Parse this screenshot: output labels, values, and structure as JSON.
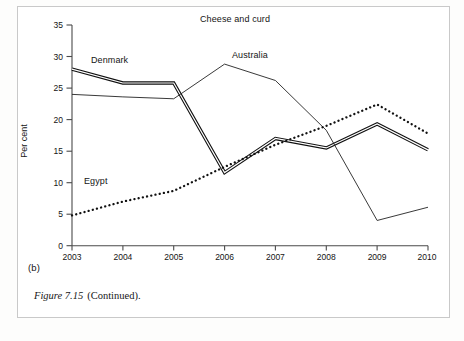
{
  "figure": {
    "panel_letter": "(b)",
    "caption_number": "Figure 7.15",
    "caption_text": "(Continued)."
  },
  "chart_data": {
    "type": "line",
    "title": "Cheese and curd",
    "xlabel": "",
    "ylabel": "Per cent",
    "x": [
      "2003",
      "2004",
      "2005",
      "2006",
      "2007",
      "2008",
      "2009",
      "2010"
    ],
    "categories": [
      "2003",
      "2004",
      "2005",
      "2006",
      "2007",
      "2008",
      "2009",
      "2010"
    ],
    "xlim": [
      2003,
      2010
    ],
    "ylim": [
      0,
      35
    ],
    "yticks": [
      0,
      5,
      10,
      15,
      20,
      25,
      30,
      35
    ],
    "ytick_labels": [
      "0",
      "5",
      "10",
      "15",
      "20",
      "25",
      "30",
      "35"
    ],
    "xtick_labels": [
      "2003",
      "2004",
      "2005",
      "2006",
      "2007",
      "2008",
      "2009",
      "2010"
    ],
    "grid": false,
    "legend": "inline-annotations",
    "series": [
      {
        "name": "Denmark",
        "style": "thick-double-solid",
        "color": "#111111",
        "values": [
          28.0,
          25.8,
          25.8,
          11.6,
          17.0,
          15.5,
          19.3,
          15.2
        ]
      },
      {
        "name": "Australia",
        "style": "thin-solid",
        "color": "#222222",
        "values": [
          24.0,
          23.6,
          23.3,
          28.8,
          26.2,
          18.3,
          4.0,
          6.1
        ]
      },
      {
        "name": "Egypt",
        "style": "dotted",
        "color": "#111111",
        "values": [
          4.8,
          7.0,
          8.7,
          12.5,
          16.0,
          19.0,
          22.4,
          17.8
        ]
      }
    ],
    "annotations": [
      {
        "text": "Denmark",
        "series": "Denmark"
      },
      {
        "text": "Australia",
        "series": "Australia"
      },
      {
        "text": "Egypt",
        "series": "Egypt"
      }
    ]
  },
  "axis": {
    "y_title": "Per cent",
    "y_ticks": [
      "35",
      "30",
      "25",
      "20",
      "15",
      "10",
      "5",
      "0"
    ],
    "x_ticks": [
      "2003",
      "2004",
      "2005",
      "2006",
      "2007",
      "2008",
      "2009",
      "2010"
    ]
  }
}
